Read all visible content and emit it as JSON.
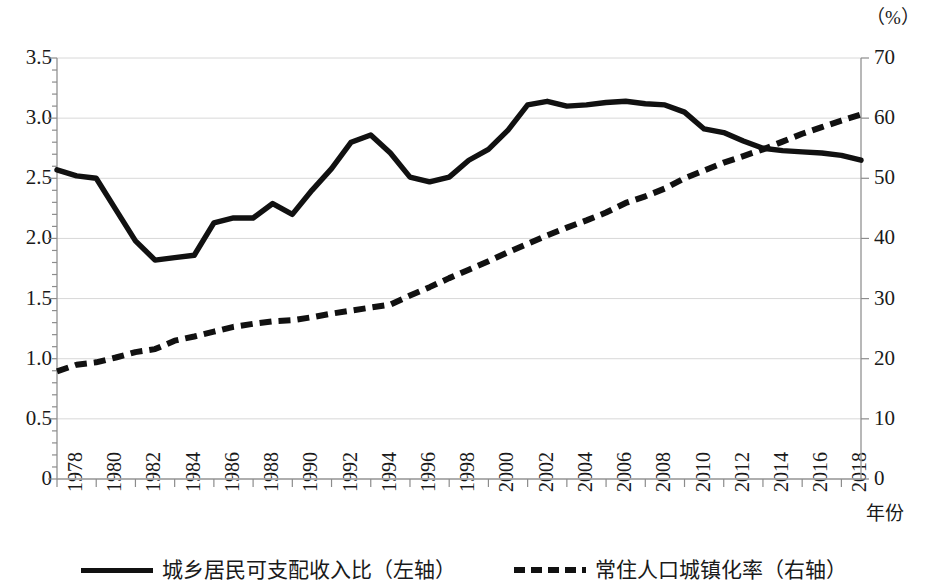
{
  "chart_data": {
    "type": "line",
    "title": "",
    "xlabel": "年份",
    "ylabel_left": "",
    "ylabel_right": "（%）",
    "x": [
      1978,
      1979,
      1980,
      1981,
      1982,
      1983,
      1984,
      1985,
      1986,
      1987,
      1988,
      1989,
      1990,
      1991,
      1992,
      1993,
      1994,
      1995,
      1996,
      1997,
      1998,
      1999,
      2000,
      2001,
      2002,
      2003,
      2004,
      2005,
      2006,
      2007,
      2008,
      2009,
      2010,
      2011,
      2012,
      2013,
      2014,
      2015,
      2016,
      2017,
      2018,
      2019
    ],
    "x_tick_labels": [
      "1978",
      "1980",
      "1982",
      "1984",
      "1986",
      "1988",
      "1990",
      "1992",
      "1994",
      "1996",
      "1998",
      "2000",
      "2002",
      "2004",
      "2006",
      "2008",
      "2010",
      "2012",
      "2014",
      "2016",
      "2018"
    ],
    "ylim_left": [
      0,
      3.5
    ],
    "ylim_right": [
      0,
      70
    ],
    "y_ticks_left": [
      "0",
      "0.5",
      "1.0",
      "1.5",
      "2.0",
      "2.5",
      "3.0",
      "3.5"
    ],
    "y_ticks_right": [
      "0",
      "10",
      "20",
      "30",
      "40",
      "50",
      "60",
      "70"
    ],
    "grid": true,
    "legend_position": "bottom",
    "series": [
      {
        "name": "城乡居民可支配收入比（左轴）",
        "axis": "left",
        "style": "solid",
        "color": "#111111",
        "values": [
          2.57,
          2.53,
          2.5,
          2.24,
          1.98,
          1.82,
          1.84,
          1.86,
          2.13,
          2.17,
          2.17,
          2.29,
          2.2,
          2.4,
          2.58,
          2.8,
          2.86,
          2.71,
          2.51,
          2.47,
          2.51,
          2.65,
          2.74,
          2.9,
          3.11,
          3.23,
          3.21,
          3.22,
          3.28,
          3.14,
          3.31,
          3.33,
          3.23,
          3.13,
          3.1,
          3.03,
          2.92,
          2.73,
          2.72,
          2.71,
          2.69,
          2.64
        ],
        "values_display": [
          2.57,
          2.52,
          2.5,
          2.24,
          1.98,
          1.82,
          1.84,
          1.86,
          2.13,
          2.17,
          2.17,
          2.29,
          2.2,
          2.4,
          2.58,
          2.8,
          2.86,
          2.71,
          2.51,
          2.47,
          2.51,
          2.65,
          2.74,
          2.9,
          3.11,
          3.14,
          3.1,
          3.11,
          3.13,
          3.14,
          3.12,
          3.11,
          3.05,
          2.91,
          2.88,
          2.81,
          2.75,
          2.73,
          2.72,
          2.71,
          2.69,
          2.65
        ]
      },
      {
        "name": "常住人口城镇化率（右轴）",
        "axis": "right",
        "style": "dashed",
        "color": "#111111",
        "values": [
          17.9,
          19.0,
          19.4,
          20.2,
          21.1,
          21.6,
          23.0,
          23.7,
          24.5,
          25.3,
          25.8,
          26.2,
          26.4,
          26.9,
          27.5,
          28.0,
          28.5,
          29.0,
          30.5,
          31.9,
          33.4,
          34.8,
          36.2,
          37.7,
          39.1,
          40.5,
          41.8,
          43.0,
          44.3,
          45.9,
          47.0,
          48.3,
          50.0,
          51.3,
          52.6,
          53.7,
          54.8,
          56.1,
          57.4,
          58.5,
          59.6,
          60.6
        ]
      }
    ]
  },
  "axes": {
    "unit_label": "（%）",
    "x_title": "年份"
  },
  "legend": {
    "items": [
      {
        "label": "城乡居民可支配收入比（左轴）",
        "style": "solid"
      },
      {
        "label": "常住人口城镇化率（右轴）",
        "style": "dashed"
      }
    ]
  }
}
